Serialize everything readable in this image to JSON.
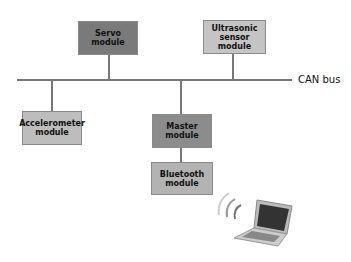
{
  "diagram": {
    "bus_label": "CAN bus",
    "modules": {
      "servo": {
        "label": "Servo module",
        "color": "#7a7a7a"
      },
      "ultrasonic": {
        "label": "Ultrasonic sensor module",
        "color": "#c4c4c4"
      },
      "accelerometer": {
        "label": "Accelerometer module",
        "color": "#bdbdbd"
      },
      "master": {
        "label": "Master module",
        "color": "#8c8c8c"
      },
      "bluetooth": {
        "label": "Bluetooth module",
        "color": "#b3b3b3"
      }
    },
    "icons": {
      "laptop": "laptop-icon",
      "wireless": "wireless-signal-icon"
    }
  }
}
